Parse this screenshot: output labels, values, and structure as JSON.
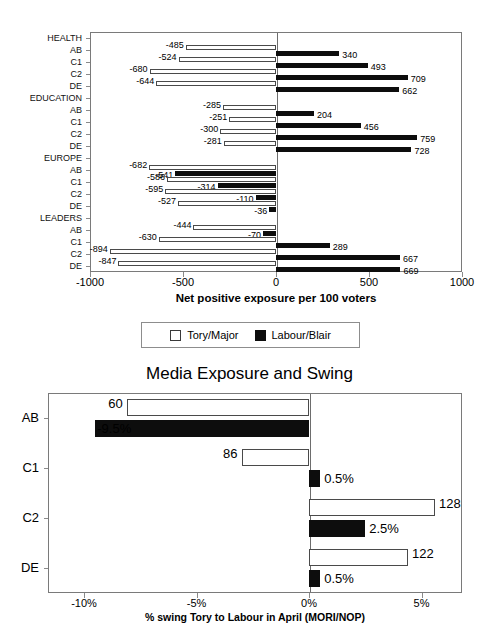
{
  "chart_data": [
    {
      "type": "bar",
      "orientation": "horizontal",
      "title": "",
      "xlabel": "Net positive exposure per 100 voters",
      "ylabel": "",
      "xlim": [
        -1000,
        1000
      ],
      "xticks": [
        -1000,
        -500,
        0,
        500,
        1000
      ],
      "xticklabels": [
        "-1000",
        "-500",
        "0",
        "500",
        "1000"
      ],
      "grid": false,
      "legend": {
        "position": "below-plot",
        "entries": [
          {
            "label": "Tory/Major",
            "style": "open-white"
          },
          {
            "label": "Labour/Blair",
            "style": "solid-black"
          }
        ]
      },
      "groups": [
        {
          "name": "HEALTH",
          "categories": [
            "AB",
            "C1",
            "C2",
            "DE"
          ],
          "series": [
            {
              "name": "Tory/Major",
              "values": [
                -485,
                -524,
                -680,
                -644
              ]
            },
            {
              "name": "Labour/Blair",
              "values": [
                340,
                493,
                709,
                662
              ]
            }
          ]
        },
        {
          "name": "EDUCATION",
          "categories": [
            "AB",
            "C1",
            "C2",
            "DE"
          ],
          "series": [
            {
              "name": "Tory/Major",
              "values": [
                -285,
                -251,
                -300,
                -281
              ]
            },
            {
              "name": "Labour/Blair",
              "values": [
                204,
                456,
                759,
                728
              ]
            }
          ]
        },
        {
          "name": "EUROPE",
          "categories": [
            "AB",
            "C1",
            "C2",
            "DE"
          ],
          "series": [
            {
              "name": "Tory/Major",
              "values": [
                -682,
                -586,
                -595,
                -527
              ]
            },
            {
              "name": "Labour/Blair",
              "values": [
                -541,
                -314,
                -110,
                -36
              ]
            }
          ]
        },
        {
          "name": "LEADERS",
          "categories": [
            "AB",
            "C1",
            "C2",
            "DE"
          ],
          "series": [
            {
              "name": "Tory/Major",
              "values": [
                -444,
                -630,
                -894,
                -847
              ]
            },
            {
              "name": "Labour/Blair",
              "values": [
                -70,
                289,
                667,
                669
              ]
            }
          ]
        }
      ]
    },
    {
      "type": "bar",
      "orientation": "horizontal",
      "title": "Media Exposure and Swing",
      "xlabel": "% swing Tory to Labour in April (MORI/NOP)",
      "ylabel": "",
      "xlim": [
        -11.6,
        6.8
      ],
      "xticks": [
        -10,
        -5,
        0,
        5
      ],
      "xticklabels": [
        "-10%",
        "-5%",
        "0%",
        "5%"
      ],
      "grid": false,
      "categories": [
        "AB",
        "C1",
        "C2",
        "DE"
      ],
      "series": [
        {
          "name": "Media exposure",
          "style": "open-white",
          "values": [
            -8.1,
            -3.0,
            5.6,
            4.4
          ],
          "labels": [
            "60",
            "86",
            "128",
            "122"
          ]
        },
        {
          "name": "% swing",
          "style": "solid-black",
          "values": [
            -9.5,
            0.5,
            2.5,
            0.5
          ],
          "labels": [
            "-9.5%",
            "0.5%",
            "2.5%",
            "0.5%"
          ]
        }
      ]
    }
  ],
  "chart1": {
    "xaxis_title": "Net positive exposure per 100 voters",
    "xticklabels": [
      "-1000",
      "-500",
      "0",
      "500",
      "1000"
    ],
    "legend": {
      "tory_label": "Tory/Major",
      "labour_label": "Labour/Blair"
    },
    "rows": [
      {
        "label": "HEALTH",
        "type": "group"
      },
      {
        "label": "AB",
        "type": "cat",
        "tory": -485,
        "labour": 340,
        "tory_text": "-485",
        "labour_text": "340"
      },
      {
        "label": "C1",
        "type": "cat",
        "tory": -524,
        "labour": 493,
        "tory_text": "-524",
        "labour_text": "493"
      },
      {
        "label": "C2",
        "type": "cat",
        "tory": -680,
        "labour": 709,
        "tory_text": "-680",
        "labour_text": "709"
      },
      {
        "label": "DE",
        "type": "cat",
        "tory": -644,
        "labour": 662,
        "tory_text": "-644",
        "labour_text": "662"
      },
      {
        "label": "EDUCATION",
        "type": "group"
      },
      {
        "label": "AB",
        "type": "cat",
        "tory": -285,
        "labour": 204,
        "tory_text": "-285",
        "labour_text": "204"
      },
      {
        "label": "C1",
        "type": "cat",
        "tory": -251,
        "labour": 456,
        "tory_text": "-251",
        "labour_text": "456"
      },
      {
        "label": "C2",
        "type": "cat",
        "tory": -300,
        "labour": 759,
        "tory_text": "-300",
        "labour_text": "759"
      },
      {
        "label": "DE",
        "type": "cat",
        "tory": -281,
        "labour": 728,
        "tory_text": "-281",
        "labour_text": "728"
      },
      {
        "label": "EUROPE",
        "type": "group"
      },
      {
        "label": "AB",
        "type": "cat",
        "tory": -682,
        "labour": -541,
        "tory_text": "-682",
        "labour_text": "-541"
      },
      {
        "label": "C1",
        "type": "cat",
        "tory": -586,
        "labour": -314,
        "tory_text": "-586",
        "labour_text": "-314"
      },
      {
        "label": "C2",
        "type": "cat",
        "tory": -595,
        "labour": -110,
        "tory_text": "-595",
        "labour_text": "-110"
      },
      {
        "label": "DE",
        "type": "cat",
        "tory": -527,
        "labour": -36,
        "tory_text": "-527",
        "labour_text": "-36"
      },
      {
        "label": "LEADERS",
        "type": "group"
      },
      {
        "label": "AB",
        "type": "cat",
        "tory": -444,
        "labour": -70,
        "tory_text": "-444",
        "labour_text": "-70"
      },
      {
        "label": "C1",
        "type": "cat",
        "tory": -630,
        "labour": 289,
        "tory_text": "-630",
        "labour_text": "289"
      },
      {
        "label": "C2",
        "type": "cat",
        "tory": -894,
        "labour": 667,
        "tory_text": "-894",
        "labour_text": "667"
      },
      {
        "label": "DE",
        "type": "cat",
        "tory": -847,
        "labour": 669,
        "tory_text": "-847",
        "labour_text": "669"
      }
    ]
  },
  "chart2": {
    "title": "Media Exposure and Swing",
    "xaxis_title": "% swing Tory to Labour in April (MORI/NOP)",
    "xticklabels": [
      "-10%",
      "-5%",
      "0%",
      "5%"
    ],
    "rows": [
      {
        "label": "AB",
        "open_val": -8.1,
        "open_text": "60",
        "solid_val": -9.5,
        "solid_text": "-9.5%"
      },
      {
        "label": "C1",
        "open_val": -3.0,
        "open_text": "86",
        "solid_val": 0.5,
        "solid_text": "0.5%"
      },
      {
        "label": "C2",
        "open_val": 5.6,
        "open_text": "128",
        "solid_val": 2.5,
        "solid_text": "2.5%"
      },
      {
        "label": "DE",
        "open_val": 4.4,
        "open_text": "122",
        "solid_val": 0.5,
        "solid_text": "0.5%"
      }
    ]
  }
}
